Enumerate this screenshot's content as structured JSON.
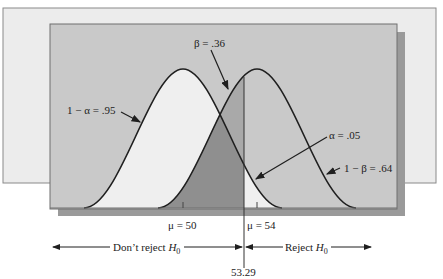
{
  "diagram": {
    "title_partial": "",
    "null_mean_label": "μ = 50",
    "alt_mean_label": "μ = 54",
    "critical_value_label": "53.29",
    "annotations": {
      "beta": "β = .36",
      "one_minus_alpha": "1 − α = .95",
      "alpha": "α = .05",
      "power": "1 − β = .64"
    },
    "regions": {
      "dont_reject_prefix": "Don’t reject ",
      "reject_prefix": "Reject ",
      "hypothesis_symbol": "H",
      "hypothesis_subscript": "0"
    },
    "colors": {
      "back_panel": "#ececec",
      "inner_panel": "#c9c9c9",
      "shadow": "#9a9a9a",
      "null_fill": "#efefef",
      "beta_fill": "#a9a9a9",
      "overlap_fill": "#8f8f8f",
      "curve_stroke": "#1f1f1f"
    }
  }
}
